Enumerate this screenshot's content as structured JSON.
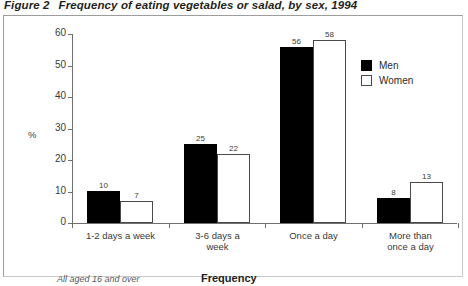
{
  "figure": {
    "label": "Figure 2",
    "caption": "Frequency of eating vegetables or salad, by sex, 1994",
    "footnote": "All aged 16 and over"
  },
  "legend": {
    "position": "top-right",
    "entries": [
      {
        "name": "Men",
        "swatch": "filled-black-square"
      },
      {
        "name": "Women",
        "swatch": "outlined-white-square"
      }
    ]
  },
  "colors": {
    "men": "#000000",
    "women": "#ffffff",
    "women_border": "#4a4a4a",
    "axis": "#6f6f6f",
    "frame": "#9d9d9d",
    "text": "#231f20"
  },
  "chart_data": {
    "type": "bar",
    "title": "Frequency of eating vegetables or salad, by sex, 1994",
    "subtitle": "",
    "xlabel": "Frequency",
    "ylabel": "%",
    "ylim": [
      0,
      60
    ],
    "yticks": [
      0,
      10,
      20,
      30,
      40,
      50,
      60
    ],
    "ytick_labels": [
      "0",
      "10",
      "20",
      "30",
      "40",
      "50",
      "60"
    ],
    "grid": false,
    "categories": [
      "1-2 days a week",
      "3-6 days a week",
      "Once a day",
      "More than once a day"
    ],
    "category_lines": [
      [
        "1-2 days a week"
      ],
      [
        "3-6 days a",
        "week"
      ],
      [
        "Once a day"
      ],
      [
        "More than",
        "once a day"
      ]
    ],
    "series": [
      {
        "name": "Men",
        "values": [
          10,
          25,
          56,
          8
        ]
      },
      {
        "name": "Women",
        "values": [
          7,
          22,
          58,
          13
        ]
      }
    ],
    "annotations": [
      "All aged 16 and over"
    ]
  }
}
